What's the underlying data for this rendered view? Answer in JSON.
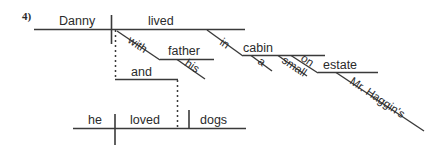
{
  "diagram": {
    "type": "sentence-diagram",
    "exercise_number": "4)",
    "sentence": "Danny lived with his father in a small cabin on Mr. Haggin's estate and he loved dogs.",
    "clauses": [
      {
        "id": "main-clause-1",
        "subject": "Danny",
        "verb": "lived",
        "modifiers": [
          {
            "word": "with",
            "type": "preposition",
            "object": "father",
            "object_modifiers": [
              {
                "word": "his",
                "type": "possessive-adjective"
              }
            ]
          },
          {
            "word": "in",
            "type": "preposition",
            "object": "cabin",
            "object_modifiers": [
              {
                "word": "a",
                "type": "article"
              },
              {
                "word": "small",
                "type": "adjective"
              }
            ]
          },
          {
            "word": "on",
            "type": "preposition",
            "object": "estate",
            "object_modifiers": [
              {
                "word": "Mr. Haggin's",
                "type": "possessive-noun"
              }
            ]
          }
        ]
      },
      {
        "id": "main-clause-2",
        "subject": "he",
        "verb": "loved",
        "object": "dogs",
        "modifiers": []
      }
    ],
    "conjunction": "and",
    "labels": {
      "danny": "Danny",
      "lived": "lived",
      "with": "with",
      "father": "father",
      "his": "his",
      "in": "in",
      "cabin": "cabin",
      "a": "a",
      "small": "small",
      "on": "on",
      "estate": "estate",
      "mr_haggins": "Mr. Haggin's",
      "and": "and",
      "he": "he",
      "loved": "loved",
      "dogs": "dogs"
    },
    "colors": {
      "line": "#3a3a3a",
      "text": "#2b2b2b",
      "background": "#ffffff"
    }
  }
}
